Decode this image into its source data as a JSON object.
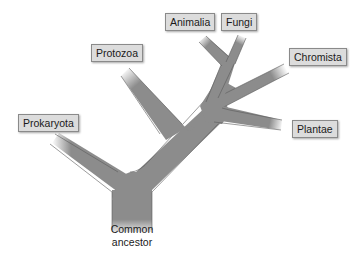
{
  "diagram": {
    "type": "phylogenetic-tree",
    "root": {
      "label_line1": "Common",
      "label_line2": "ancestor"
    },
    "leaves": [
      {
        "id": "prokaryota",
        "label": "Prokaryota"
      },
      {
        "id": "protozoa",
        "label": "Protozoa"
      },
      {
        "id": "animalia",
        "label": "Animalia"
      },
      {
        "id": "fungi",
        "label": "Fungi"
      },
      {
        "id": "chromista",
        "label": "Chromista"
      },
      {
        "id": "plantae",
        "label": "Plantae"
      }
    ],
    "colors": {
      "branch": "#8c8c8c",
      "branch_edge": "#5a5a5a",
      "label_bg": "#dcdcdc",
      "label_border": "#8a8a8a",
      "background": "#ffffff"
    }
  }
}
